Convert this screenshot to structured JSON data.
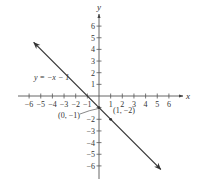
{
  "chart_data": {
    "type": "line",
    "title": "",
    "xlabel": "x",
    "ylabel": "y",
    "xlim": [
      -6,
      6
    ],
    "ylim": [
      -6,
      6
    ],
    "grid": false,
    "x_ticks": [
      -6,
      -5,
      -4,
      -3,
      -2,
      -1,
      1,
      2,
      3,
      4,
      5,
      6
    ],
    "x_tick_labels": [
      "−6",
      "−5",
      "−4",
      "−3",
      "−2",
      "−1",
      "1",
      "2",
      "3",
      "4",
      "5",
      "6"
    ],
    "y_ticks": [
      6,
      5,
      4,
      3,
      2,
      1,
      -1,
      -2,
      -3,
      -4,
      -5,
      -6
    ],
    "y_tick_labels": [
      "6",
      "5",
      "4",
      "3",
      "2",
      "1",
      "−1",
      "−2",
      "−3",
      "−4",
      "−5",
      "−6"
    ],
    "series": [
      {
        "name": "y = −x − 1",
        "equation": "y = -x - 1",
        "slope": -1,
        "intercept": -1,
        "x_range": [
          -5.6,
          5.3
        ],
        "arrows": "both",
        "color": "#333333"
      }
    ],
    "annotations": [
      {
        "text": "y = −x − 1",
        "type": "equation-label"
      },
      {
        "text": "(0, −1)",
        "point": [
          0,
          -1
        ],
        "leader_line": true
      },
      {
        "text": "(1, −2)",
        "point": [
          1,
          -2
        ],
        "leader_line": false
      }
    ]
  }
}
